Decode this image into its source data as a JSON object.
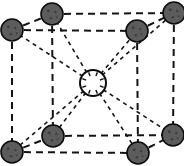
{
  "figure": {
    "name": "body-centered-cubic-unit-cell",
    "width": 184,
    "height": 166,
    "background_color": "#ffffff",
    "line_color": "#141414",
    "line_style": "dashed",
    "corner_atom_fill": "#5c5c5c",
    "corner_atom_stroke": "#0c0c0c",
    "center_atom_fill": "#ffffff",
    "center_atom_stroke": "#0c0c0c",
    "corner_atom_radius": 11,
    "center_atom_radius": 13,
    "edge_dash_pattern": "7,5",
    "bond_dash_pattern": "4,4"
  },
  "atoms": {
    "corner_label": "corner-atom",
    "center_label": "center-atom",
    "corner_count": 8,
    "center_count": 1,
    "corners": [
      {
        "id": "front-top-left",
        "x": 12,
        "y": 30,
        "face": "front"
      },
      {
        "id": "front-top-right",
        "x": 137,
        "y": 31,
        "face": "front"
      },
      {
        "id": "front-bottom-left",
        "x": 12,
        "y": 152,
        "face": "front"
      },
      {
        "id": "front-bottom-right",
        "x": 138,
        "y": 153,
        "face": "front"
      },
      {
        "id": "back-top-left",
        "x": 52,
        "y": 14,
        "face": "back"
      },
      {
        "id": "back-top-right",
        "x": 174,
        "y": 13,
        "face": "back"
      },
      {
        "id": "back-bottom-left",
        "x": 53,
        "y": 136,
        "face": "back"
      },
      {
        "id": "back-bottom-right",
        "x": 173,
        "y": 135,
        "face": "back"
      }
    ],
    "center": {
      "id": "body-center",
      "x": 93,
      "y": 83
    }
  },
  "edges": [
    {
      "id": "front-top",
      "from": "front-top-left",
      "to": "front-top-right"
    },
    {
      "id": "front-bottom",
      "from": "front-bottom-left",
      "to": "front-bottom-right"
    },
    {
      "id": "front-left",
      "from": "front-top-left",
      "to": "front-bottom-left"
    },
    {
      "id": "front-right",
      "from": "front-top-right",
      "to": "front-bottom-right"
    },
    {
      "id": "back-top",
      "from": "back-top-left",
      "to": "back-top-right"
    },
    {
      "id": "back-bottom",
      "from": "back-bottom-left",
      "to": "back-bottom-right"
    },
    {
      "id": "back-left",
      "from": "back-top-left",
      "to": "back-bottom-left"
    },
    {
      "id": "back-right",
      "from": "back-top-right",
      "to": "back-bottom-right"
    },
    {
      "id": "depth-top-left",
      "from": "front-top-left",
      "to": "back-top-left"
    },
    {
      "id": "depth-top-right",
      "from": "front-top-right",
      "to": "back-top-right"
    },
    {
      "id": "depth-bottom-left",
      "from": "front-bottom-left",
      "to": "back-bottom-left"
    },
    {
      "id": "depth-bottom-right",
      "from": "front-bottom-right",
      "to": "back-bottom-right"
    }
  ],
  "center_bonds": [
    {
      "id": "bond-front-top-left",
      "to": "front-top-left"
    },
    {
      "id": "bond-front-top-right",
      "to": "front-top-right"
    },
    {
      "id": "bond-front-bottom-left",
      "to": "front-bottom-left"
    },
    {
      "id": "bond-front-bottom-right",
      "to": "front-bottom-right"
    },
    {
      "id": "bond-back-top-left",
      "to": "back-top-left"
    },
    {
      "id": "bond-back-top-right",
      "to": "back-top-right"
    },
    {
      "id": "bond-back-bottom-left",
      "to": "back-bottom-left"
    },
    {
      "id": "bond-back-bottom-right",
      "to": "back-bottom-right"
    }
  ]
}
